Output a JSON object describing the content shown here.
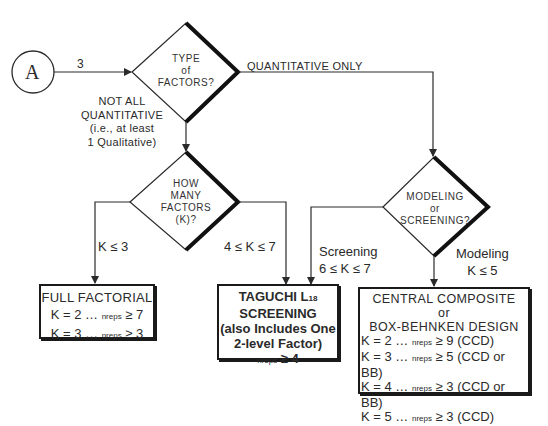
{
  "connector": {
    "label": "A"
  },
  "edges": {
    "a_to_type": "3",
    "quantitative_only": "QUANTITATIVE ONLY",
    "not_all_quantitative": [
      "NOT ALL",
      "QUANTITATIVE",
      "(i.e., at least",
      "1 Qualitative)"
    ],
    "k_le_3": "K ≤ 3",
    "k_4_to_7": "4 ≤ K ≤ 7",
    "screening": [
      "Screening",
      "6 ≤ K ≤ 7"
    ],
    "modeling": [
      "Modeling",
      "K ≤ 5"
    ]
  },
  "decisions": {
    "type_of_factors": [
      "TYPE",
      "of",
      "FACTORS?"
    ],
    "how_many_factors": [
      "HOW",
      "MANY",
      "FACTORS",
      "(K)?"
    ],
    "modeling_or_screening": [
      "MODELING",
      "or",
      "SCREENING?"
    ]
  },
  "outcomes": {
    "full_factorial": {
      "title": "FULL FACTORIAL",
      "rows": [
        {
          "k": "K = 2 … ",
          "n": "nreps",
          "ge": " ≥ 7"
        },
        {
          "k": "K = 3 … ",
          "n": "nreps",
          "ge": " ≥ 3"
        }
      ]
    },
    "taguchi": {
      "title_main": "TAGUCHI L",
      "title_sub": "18",
      "lines": [
        "SCREENING",
        "(also Includes One",
        "2-level Factor)"
      ],
      "reps_n": "nreps",
      "reps_ge": " ≥ 4"
    },
    "ccd_bb": {
      "title": [
        "CENTRAL COMPOSITE",
        "or",
        "BOX-BEHNKEN DESIGN"
      ],
      "rows": [
        {
          "k": "K = 2 … ",
          "n": "nreps",
          "ge": " ≥ 9 (CCD)"
        },
        {
          "k": "K = 3 … ",
          "n": "nreps",
          "ge": " ≥ 5 (CCD or BB)"
        },
        {
          "k": "K = 4 … ",
          "n": "nreps",
          "ge": " ≥ 3 (CCD or BB)"
        },
        {
          "k": "K = 5 … ",
          "n": "nreps",
          "ge": " ≥ 3 (CCD)"
        }
      ]
    }
  }
}
